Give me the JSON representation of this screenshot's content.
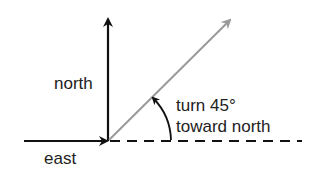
{
  "diagram": {
    "labels": {
      "north": "north",
      "east": "east",
      "turn_line1": "turn 45°",
      "turn_line2": "toward north"
    },
    "angle_degrees": 45,
    "colors": {
      "axis": "#111111",
      "rotated_vector": "#9a9a9a",
      "text": "#222222",
      "background": "#ffffff"
    }
  }
}
